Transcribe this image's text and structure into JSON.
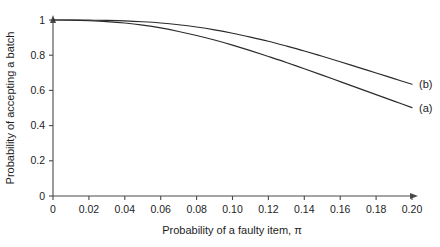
{
  "chart_data": {
    "type": "line",
    "title": "",
    "xlabel": "Probability of a faulty item, π",
    "ylabel": "Probability of accepting a batch",
    "xlim": [
      0,
      0.2
    ],
    "ylim": [
      0,
      1
    ],
    "grid": false,
    "legend_position": "inline-right-end",
    "x_ticks": [
      0,
      0.02,
      0.04,
      0.06,
      0.08,
      0.1,
      0.12,
      0.14,
      0.16,
      0.18,
      0.2
    ],
    "x_tick_labels": [
      "0",
      "0.02",
      "0.04",
      "0.06",
      "0.08",
      "0.10",
      "0.12",
      "0.14",
      "0.16",
      "0.18",
      "0.20"
    ],
    "y_ticks": [
      0,
      0.2,
      0.4,
      0.6,
      0.8,
      1
    ],
    "y_tick_labels": [
      "0",
      "0.2",
      "0.4",
      "0.6",
      "0.8",
      "1"
    ],
    "x_axis_arrow": true,
    "y_axis_arrow": true,
    "series": [
      {
        "name": "(a)",
        "label": "(a)",
        "x": [
          0,
          0.01,
          0.02,
          0.03,
          0.04,
          0.05,
          0.06,
          0.07,
          0.08,
          0.09,
          0.1,
          0.11,
          0.12,
          0.13,
          0.14,
          0.15,
          0.16,
          0.17,
          0.18,
          0.19,
          0.2
        ],
        "values": [
          1.0,
          0.999,
          0.996,
          0.991,
          0.983,
          0.971,
          0.955,
          0.935,
          0.912,
          0.886,
          0.857,
          0.826,
          0.793,
          0.759,
          0.723,
          0.687,
          0.65,
          0.613,
          0.576,
          0.539,
          0.502
        ]
      },
      {
        "name": "(b)",
        "label": "(b)",
        "x": [
          0,
          0.01,
          0.02,
          0.03,
          0.04,
          0.05,
          0.06,
          0.07,
          0.08,
          0.09,
          0.1,
          0.11,
          0.12,
          0.13,
          0.14,
          0.15,
          0.16,
          0.17,
          0.18,
          0.19,
          0.2
        ],
        "values": [
          1.0,
          1.0,
          0.999,
          0.998,
          0.995,
          0.99,
          0.983,
          0.973,
          0.96,
          0.944,
          0.925,
          0.903,
          0.879,
          0.852,
          0.824,
          0.794,
          0.763,
          0.731,
          0.699,
          0.667,
          0.635
        ]
      }
    ],
    "colors": {
      "curve": "#2b2b2b",
      "axis": "#4a4a4a",
      "background": "#ffffff",
      "text": "#1d1d1d"
    }
  }
}
